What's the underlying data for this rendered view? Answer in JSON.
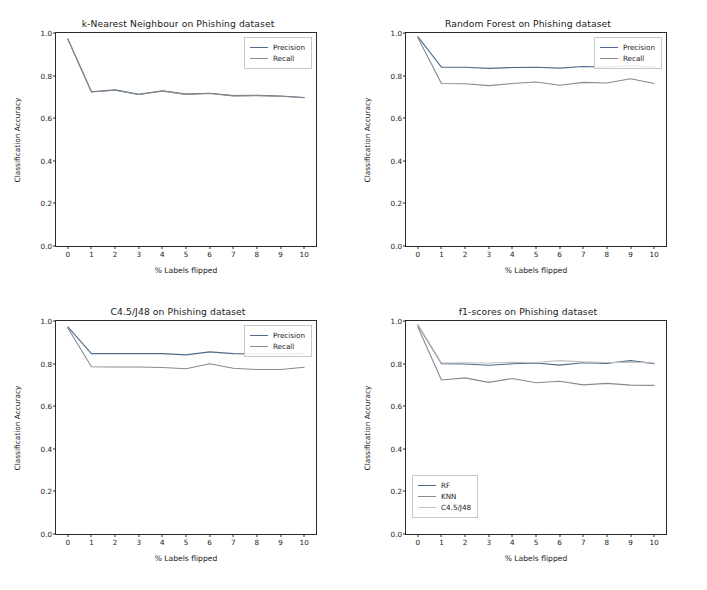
{
  "figure": {
    "background": "#ffffff",
    "rows": 2,
    "cols": 2
  },
  "axis_common": {
    "xlabel": "% Labels flipped",
    "ylabel": "Classification Accuracy",
    "xticks": [
      "0",
      "1",
      "2",
      "3",
      "4",
      "5",
      "6",
      "7",
      "8",
      "9",
      "10"
    ],
    "yticks": [
      "0.0",
      "0.2",
      "0.4",
      "0.6",
      "0.8",
      "1.0"
    ],
    "xlim": [
      -0.5,
      10.5
    ],
    "ylim": [
      0.0,
      1.0
    ]
  },
  "chart_data": [
    {
      "type": "line",
      "title": "k-Nearest Neighbour on Phishing dataset",
      "xlabel": "% Labels flipped",
      "ylabel": "Classification Accuracy",
      "xlim": [
        -0.5,
        10.5
      ],
      "ylim": [
        0.0,
        1.0
      ],
      "xticks": [
        0,
        1,
        2,
        3,
        4,
        5,
        6,
        7,
        8,
        9,
        10
      ],
      "yticks": [
        0.0,
        0.2,
        0.4,
        0.6,
        0.8,
        1.0
      ],
      "grid": false,
      "legend_position": "upper right",
      "x": [
        0,
        1,
        2,
        3,
        4,
        5,
        6,
        7,
        8,
        9,
        10
      ],
      "series": [
        {
          "name": "Precision",
          "color": "#4d6b8a",
          "values": [
            0.972,
            0.724,
            0.733,
            0.712,
            0.729,
            0.713,
            0.717,
            0.706,
            0.707,
            0.704,
            0.697
          ]
        },
        {
          "name": "Recall",
          "color": "#8a8a8a",
          "values": [
            0.972,
            0.723,
            0.731,
            0.711,
            0.727,
            0.712,
            0.716,
            0.705,
            0.706,
            0.703,
            0.696
          ]
        }
      ]
    },
    {
      "type": "line",
      "title": "Random Forest on Phishing dataset",
      "xlabel": "% Labels flipped",
      "ylabel": "Classification Accuracy",
      "xlim": [
        -0.5,
        10.5
      ],
      "ylim": [
        0.0,
        1.0
      ],
      "xticks": [
        0,
        1,
        2,
        3,
        4,
        5,
        6,
        7,
        8,
        9,
        10
      ],
      "yticks": [
        0.0,
        0.2,
        0.4,
        0.6,
        0.8,
        1.0
      ],
      "grid": false,
      "legend_position": "upper right",
      "x": [
        0,
        1,
        2,
        3,
        4,
        5,
        6,
        7,
        8,
        9,
        10
      ],
      "series": [
        {
          "name": "Precision",
          "color": "#4d6b8a",
          "values": [
            0.983,
            0.84,
            0.839,
            0.834,
            0.838,
            0.839,
            0.835,
            0.843,
            0.84,
            0.847,
            0.84
          ]
        },
        {
          "name": "Recall",
          "color": "#8a8a8a",
          "values": [
            0.979,
            0.763,
            0.762,
            0.753,
            0.763,
            0.77,
            0.755,
            0.768,
            0.765,
            0.785,
            0.763
          ]
        }
      ]
    },
    {
      "type": "line",
      "title": "C4.5/J48 on Phishing dataset",
      "xlabel": "% Labels flipped",
      "ylabel": "Classification Accuracy",
      "xlim": [
        -0.5,
        10.5
      ],
      "ylim": [
        0.0,
        1.0
      ],
      "xticks": [
        0,
        1,
        2,
        3,
        4,
        5,
        6,
        7,
        8,
        9,
        10
      ],
      "yticks": [
        0.0,
        0.2,
        0.4,
        0.6,
        0.8,
        1.0
      ],
      "grid": false,
      "legend_position": "upper right",
      "x": [
        0,
        1,
        2,
        3,
        4,
        5,
        6,
        7,
        8,
        9,
        10
      ],
      "series": [
        {
          "name": "Precision",
          "color": "#4d6b8a",
          "values": [
            0.972,
            0.847,
            0.847,
            0.847,
            0.847,
            0.841,
            0.855,
            0.847,
            0.845,
            0.845,
            0.847
          ]
        },
        {
          "name": "Recall",
          "color": "#8a8a8a",
          "values": [
            0.967,
            0.785,
            0.784,
            0.784,
            0.782,
            0.776,
            0.799,
            0.778,
            0.772,
            0.772,
            0.783
          ]
        }
      ]
    },
    {
      "type": "line",
      "title": "f1-scores on Phishing dataset",
      "xlabel": "% Labels flipped",
      "ylabel": "Classification Accuracy",
      "xlim": [
        -0.5,
        10.5
      ],
      "ylim": [
        0.0,
        1.0
      ],
      "xticks": [
        0,
        1,
        2,
        3,
        4,
        5,
        6,
        7,
        8,
        9,
        10
      ],
      "yticks": [
        0.0,
        0.2,
        0.4,
        0.6,
        0.8,
        1.0
      ],
      "grid": false,
      "legend_position": "lower left",
      "x": [
        0,
        1,
        2,
        3,
        4,
        5,
        6,
        7,
        8,
        9,
        10
      ],
      "series": [
        {
          "name": "RF",
          "color": "#4d6b8a",
          "values": [
            0.981,
            0.8,
            0.798,
            0.792,
            0.799,
            0.803,
            0.793,
            0.804,
            0.801,
            0.814,
            0.8
          ]
        },
        {
          "name": "KNN",
          "color": "#8a8a8a",
          "values": [
            0.972,
            0.723,
            0.733,
            0.712,
            0.73,
            0.71,
            0.717,
            0.7,
            0.707,
            0.699,
            0.698
          ]
        },
        {
          "name": "C4.5/J48",
          "color": "#c2c2c2",
          "values": [
            0.985,
            0.803,
            0.804,
            0.803,
            0.806,
            0.805,
            0.814,
            0.808,
            0.805,
            0.807,
            0.803
          ]
        }
      ]
    }
  ]
}
